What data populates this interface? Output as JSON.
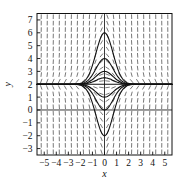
{
  "chart_data": {
    "type": "line",
    "title": "",
    "subtitle": "",
    "xlabel": "x",
    "ylabel": "y",
    "xlim": [
      -5.6,
      5.6
    ],
    "ylim": [
      -3.5,
      7.5
    ],
    "xticks": [
      -5,
      -4,
      -3,
      -2,
      -1,
      0,
      1,
      2,
      3,
      4,
      5
    ],
    "xticklabels": [
      "−5",
      "−4",
      "−3",
      "−2",
      "−1",
      "0",
      "1",
      "2",
      "3",
      "4",
      "5"
    ],
    "yticks": [
      -3,
      -2,
      -1,
      0,
      1,
      2,
      3,
      4,
      5,
      6,
      7
    ],
    "yticklabels": [
      "−3",
      "−2",
      "−1",
      "0",
      "1",
      "2",
      "3",
      "4",
      "5",
      "6",
      "7"
    ],
    "grid": false,
    "frame": true,
    "legend": null,
    "equilibrium_y": 2,
    "slope_field": {
      "present": true,
      "formula": "dy/dx = -2x(y-2)",
      "x_start": -5.25,
      "x_step": 0.5,
      "x_count": 22,
      "y_start": -3.25,
      "y_step": 0.5,
      "y_count": 22,
      "tick_len": 4.6,
      "color": "#555555",
      "width": 0.8
    },
    "series": [
      {
        "name": "peak-6.0",
        "c": 4.0,
        "color": "#111111",
        "width": 1.1
      },
      {
        "name": "peak-4.0",
        "c": 2.0,
        "color": "#111111",
        "width": 1.1
      },
      {
        "name": "peak-3.0",
        "c": 1.0,
        "color": "#111111",
        "width": 1.1
      },
      {
        "name": "peak-2.5",
        "c": 0.5,
        "color": "#111111",
        "width": 1.1
      },
      {
        "name": "dip-1.0",
        "c": -1.0,
        "color": "#111111",
        "width": 1.1
      },
      {
        "name": "dip-0.0",
        "c": -2.0,
        "color": "#111111",
        "width": 1.1
      },
      {
        "name": "dip-minus2.0",
        "c": -4.0,
        "color": "#111111",
        "width": 1.1
      }
    ],
    "axis_lines": {
      "x_axis_y": 0,
      "y_axis_x": 0,
      "color": "#222222"
    }
  },
  "labels": {
    "xlabel": "x",
    "ylabel": "y"
  }
}
